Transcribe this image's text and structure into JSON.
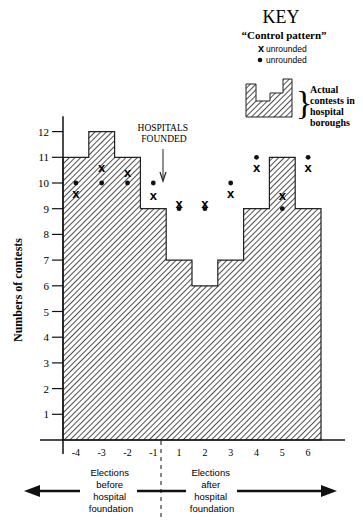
{
  "chart_data": {
    "type": "bar",
    "title": "",
    "xlabel": "",
    "ylabel": "Numbers of contests",
    "ylim": [
      0,
      12.5
    ],
    "yticks": [
      1,
      2,
      3,
      4,
      5,
      6,
      7,
      8,
      9,
      10,
      11,
      12
    ],
    "categories": [
      "-4",
      "-3",
      "-2",
      "-1",
      "1",
      "2",
      "3",
      "4",
      "5",
      "6"
    ],
    "series": [
      {
        "name": "Actual contests in hospital boroughs",
        "style": "hatched step bars",
        "values": [
          11,
          12,
          11,
          9,
          7,
          6,
          7,
          9,
          11,
          9
        ]
      },
      {
        "name": "Control pattern (x unrounded)",
        "style": "x marker",
        "values": [
          9.6,
          10.6,
          10.4,
          9.5,
          9.2,
          9.2,
          9.6,
          10.6,
          9.5,
          10.6
        ]
      },
      {
        "name": "Control pattern (dot unrounded)",
        "style": "dot marker",
        "values": [
          10,
          10,
          10,
          10,
          9,
          9,
          10,
          11,
          9,
          11
        ]
      }
    ],
    "annotations": [
      {
        "text": "HOSPITALS FOUNDED",
        "at": "between -1 and 1",
        "arrow": "down"
      },
      {
        "text": "Elections before hospital foundation",
        "arrow": "left"
      },
      {
        "text": "Elections after hospital foundation",
        "arrow": "right"
      }
    ],
    "legend": {
      "title": "KEY",
      "subtitle": "\"Control pattern\"",
      "entries": [
        "x unrounded",
        "● unrounded",
        "Actual contests in hospital boroughs"
      ],
      "position": "top-right"
    },
    "grid": false
  },
  "key": {
    "title": "KEY",
    "subtitle": "“Control pattern”",
    "x_label": "unrounded",
    "dot_label": "unrounded",
    "actual_label_lines": [
      "Actual",
      "contests in",
      "hospital",
      "boroughs"
    ]
  },
  "annotation": {
    "hospitals_line1": "HOSPITALS",
    "hospitals_line2": "FOUNDED",
    "before_lines": [
      "Elections",
      "before",
      "hospital",
      "foundation"
    ],
    "after_lines": [
      "Elections",
      "after",
      "hospital",
      "foundation"
    ]
  },
  "axis": {
    "ylabel": "Numbers of contests",
    "x_marker": "x"
  }
}
